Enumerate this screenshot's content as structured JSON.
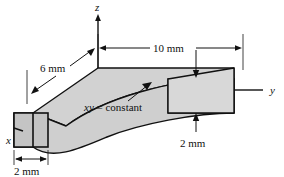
{
  "figure": {
    "background_color": "#ffffff",
    "line_color": "#111111",
    "face_fill_top": "#d2d2d2",
    "face_fill_front": "#cfcfcf",
    "face_fill_end": "#c4c4c4",
    "face_fill_right": "#d8d8d8"
  },
  "axes": [
    {
      "name": "z-axis",
      "label": "z",
      "direction": "up"
    },
    {
      "name": "y-axis",
      "label": "y",
      "direction": "right"
    },
    {
      "name": "x-axis",
      "label": "x",
      "direction": "down-left"
    }
  ],
  "dimensions": [
    {
      "name": "length",
      "label": "10 mm",
      "orientation": "horizontal",
      "style": "double-arrow"
    },
    {
      "name": "depth",
      "label": "6 mm",
      "orientation": "diagonal",
      "style": "double-arrow"
    },
    {
      "name": "width",
      "label": "2 mm",
      "orientation": "horizontal",
      "style": "double-arrow"
    },
    {
      "name": "thickness",
      "label": "2 mm",
      "orientation": "vertical",
      "style": "leader-arrows"
    }
  ],
  "annotation": {
    "name": "profile-equation",
    "variable": "xy",
    "relation": " = constant",
    "full_label": "xy = constant"
  }
}
